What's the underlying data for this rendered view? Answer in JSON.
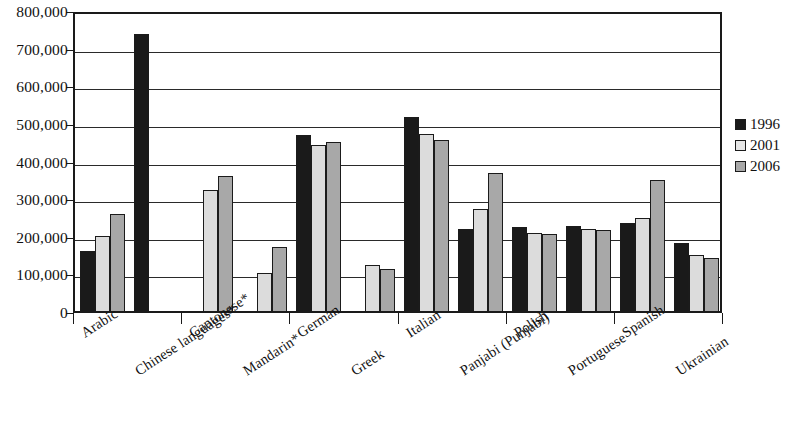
{
  "chart_data": {
    "type": "bar",
    "title": "",
    "subtitle": "",
    "xlabel": "",
    "ylabel": "",
    "ylim": [
      0,
      800000
    ],
    "ytick_labels": [
      "800,000",
      "700,000",
      "600,000",
      "500,000",
      "400,000",
      "300,000",
      "200,000",
      "100,000",
      "0"
    ],
    "ytick_values": [
      800000,
      700000,
      600000,
      500000,
      400000,
      300000,
      200000,
      100000,
      0
    ],
    "grid": "horizontal",
    "legend_position": "right",
    "categories": [
      "Arabic",
      "Chinese languages*",
      "Cantonese*",
      "Mandarin*",
      "German",
      "Greek",
      "Italian",
      "Panjabi (Punjabi)",
      "Polish",
      "Portuguese",
      "Spanish",
      "Ukrainian"
    ],
    "series": [
      {
        "name": "1996",
        "color": "#1a1a1a",
        "values": [
          160000,
          735000,
          null,
          null,
          467000,
          null,
          515000,
          218000,
          222000,
          225000,
          233000,
          180000
        ]
      },
      {
        "name": "2001",
        "color": "#dcdcdc",
        "values": [
          200000,
          null,
          322000,
          100000,
          440000,
          122000,
          470000,
          272000,
          208000,
          218000,
          247000,
          150000
        ]
      },
      {
        "name": "2006",
        "color": "#a8a8a8",
        "values": [
          258000,
          null,
          360000,
          170000,
          450000,
          112000,
          455000,
          367000,
          205000,
          215000,
          348000,
          142000
        ]
      }
    ]
  },
  "legend": {
    "items": [
      {
        "label": "1996"
      },
      {
        "label": "2001"
      },
      {
        "label": "2006"
      }
    ]
  }
}
